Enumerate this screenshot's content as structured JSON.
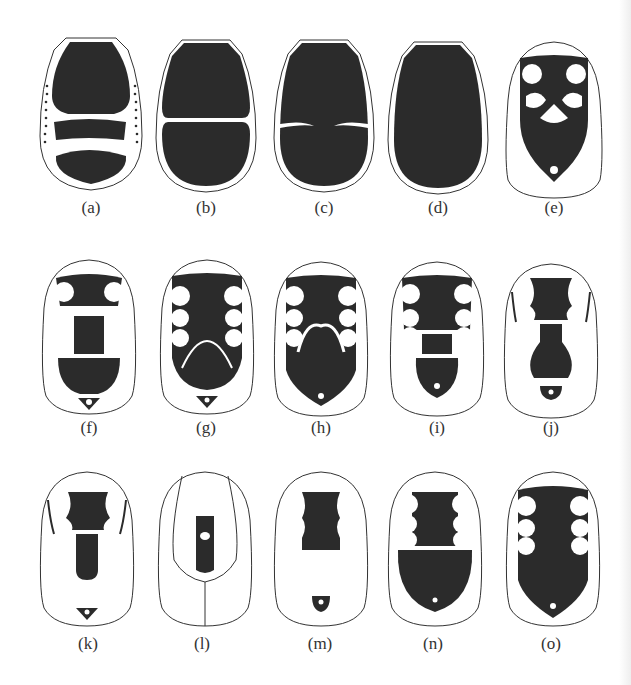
{
  "figure": {
    "ink_color": "#2b2b2b",
    "outline_color": "#333333",
    "background": "#ffffff",
    "panels": [
      {
        "id": "a",
        "label": "(a)"
      },
      {
        "id": "b",
        "label": "(b)"
      },
      {
        "id": "c",
        "label": "(c)"
      },
      {
        "id": "d",
        "label": "(d)"
      },
      {
        "id": "e",
        "label": "(e)"
      },
      {
        "id": "f",
        "label": "(f)"
      },
      {
        "id": "g",
        "label": "(g)"
      },
      {
        "id": "h",
        "label": "(h)"
      },
      {
        "id": "i",
        "label": "(i)"
      },
      {
        "id": "j",
        "label": "(j)"
      },
      {
        "id": "k",
        "label": "(k)"
      },
      {
        "id": "l",
        "label": "(l)"
      },
      {
        "id": "m",
        "label": "(m)"
      },
      {
        "id": "n",
        "label": "(n)"
      },
      {
        "id": "o",
        "label": "(o)"
      }
    ]
  }
}
